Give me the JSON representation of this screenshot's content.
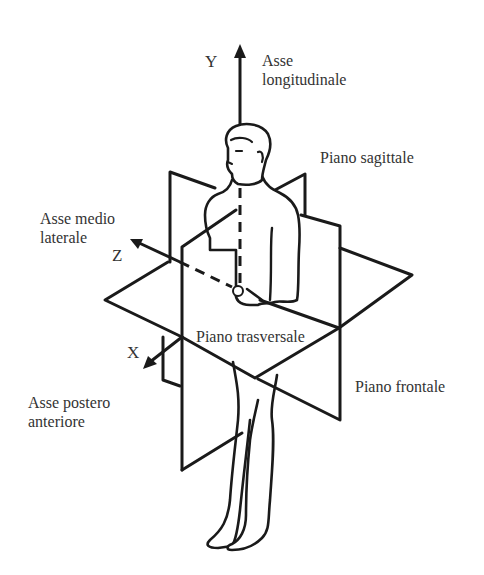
{
  "figure": {
    "type": "anatomical-planes-diagram",
    "axes": [
      {
        "letter": "Y",
        "name": "Asse longitudinale",
        "name_line1": "Asse",
        "name_line2": "longitudinale"
      },
      {
        "letter": "Z",
        "name": "Asse medio laterale",
        "name_line1": "Asse medio",
        "name_line2": "laterale"
      },
      {
        "letter": "X",
        "name": "Asse postero anteriore",
        "name_line1": "Asse postero",
        "name_line2": "anteriore"
      }
    ],
    "planes": [
      {
        "name": "Piano sagittale"
      },
      {
        "name": "Piano trasversale"
      },
      {
        "name": "Piano frontale"
      }
    ],
    "colors": {
      "line": "#1a1a1a",
      "text": "#333333",
      "background": "#ffffff"
    }
  }
}
